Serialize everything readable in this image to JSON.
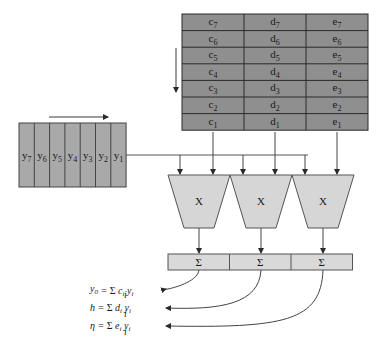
{
  "colors": {
    "coef_table_fill": "#8f8f8f",
    "y_register_fill": "#a9a9a9",
    "multiplier_fill": "#d6d6d6",
    "sum_fill": "#d9d9d9",
    "line": "#3a3a3a"
  },
  "coef_table": {
    "columns": [
      "c",
      "d",
      "e"
    ],
    "rows": [
      [
        "c7",
        "d7",
        "e7"
      ],
      [
        "c6",
        "d6",
        "e6"
      ],
      [
        "c5",
        "d5",
        "e5"
      ],
      [
        "c4",
        "d4",
        "e4"
      ],
      [
        "c3",
        "d3",
        "e3"
      ],
      [
        "c2",
        "d2",
        "e2"
      ],
      [
        "c1",
        "d1",
        "e1"
      ]
    ],
    "direction_arrow": "down-arrow"
  },
  "y_register": {
    "cells": [
      "y7",
      "y6",
      "y5",
      "y4",
      "y3",
      "y2",
      "y1"
    ],
    "direction_arrow": "right-arrow"
  },
  "multipliers": [
    {
      "label": "X"
    },
    {
      "label": "X"
    },
    {
      "label": "X"
    }
  ],
  "summers": [
    {
      "label": "Σ"
    },
    {
      "label": "Σ"
    },
    {
      "label": "Σ"
    }
  ],
  "equations": [
    {
      "lhs": "y",
      "lhs_sub": "0",
      "coef": "c"
    },
    {
      "lhs": "h",
      "lhs_sub": "",
      "coef": "d"
    },
    {
      "lhs": "η",
      "lhs_sub": "",
      "coef": "e"
    }
  ]
}
